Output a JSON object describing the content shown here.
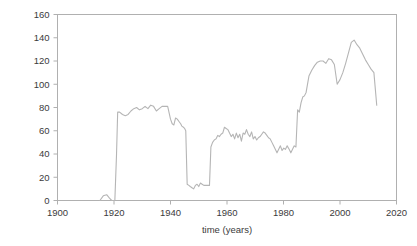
{
  "chart_data": {
    "type": "line",
    "title": "",
    "xlabel": "time (years)",
    "ylabel": "rain gauge stations (number)",
    "xlim": [
      1900,
      2020
    ],
    "ylim": [
      0,
      160
    ],
    "xticks": [
      1900,
      1920,
      1940,
      1960,
      1980,
      2000,
      2020
    ],
    "yticks": [
      0,
      20,
      40,
      60,
      80,
      100,
      120,
      140,
      160
    ],
    "grid": false,
    "legend": null,
    "line_color": "#b5b5b5",
    "series": [
      {
        "name": "rain gauge stations",
        "x": [
          1915,
          1916,
          1917,
          1918,
          1919,
          1920,
          1921,
          1922,
          1923,
          1924,
          1925,
          1926,
          1927,
          1928,
          1929,
          1930,
          1931,
          1932,
          1933,
          1934,
          1935,
          1936,
          1937,
          1938,
          1939,
          1940,
          1941,
          1942,
          1943,
          1944,
          1945,
          1946,
          1947,
          1948,
          1949,
          1950,
          1951,
          1952,
          1953,
          1954,
          1955,
          1956,
          1957,
          1958,
          1959,
          1960,
          1961,
          1962,
          1963,
          1964,
          1965,
          1966,
          1967,
          1968,
          1969,
          1970,
          1971,
          1972,
          1973,
          1974,
          1975,
          1976,
          1977,
          1978,
          1979,
          1980,
          1981,
          1982,
          1983,
          1984,
          1985,
          1986,
          1987,
          1988,
          1989,
          1990,
          1991,
          1992,
          1993,
          1994,
          1995,
          1996,
          1997,
          1998,
          1999,
          2000,
          2001,
          2002,
          2003,
          2004,
          2005,
          2006,
          2007,
          2008,
          2009,
          2010,
          2011,
          2012,
          2013,
          2014,
          2015,
          2016,
          2017,
          2018
        ],
        "values": [
          0,
          3,
          4,
          2,
          0,
          0,
          62,
          76,
          75,
          73,
          74,
          76,
          78,
          80,
          79,
          78,
          80,
          79,
          82,
          81,
          76,
          78,
          80,
          81,
          81,
          75,
          66,
          65,
          71,
          70,
          69,
          68,
          66,
          62,
          62,
          60,
          14,
          13,
          12,
          10,
          13,
          14,
          12,
          15,
          14,
          13,
          13,
          13,
          46,
          50,
          52,
          53,
          56,
          55,
          57,
          58,
          63,
          62,
          61,
          58,
          55,
          57,
          53,
          58,
          54,
          57,
          51,
          58,
          57,
          61,
          57,
          55,
          59,
          53,
          55,
          52,
          54,
          55,
          57,
          59,
          58,
          56,
          54,
          53,
          50,
          47,
          44,
          41,
          44,
          47,
          43,
          45,
          44,
          47,
          78,
          76,
          84,
          89,
          90,
          93,
          107,
          112,
          116,
          119
        ],
        "note": "Series values correspond sequentially to the plotted year positions."
      }
    ],
    "polyline_points_normalized": [
      [
        1915.0,
        0
      ],
      [
        1916.2,
        4
      ],
      [
        1917.4,
        5
      ],
      [
        1918.4,
        2
      ],
      [
        1919.2,
        0
      ],
      [
        1920.3,
        0
      ],
      [
        1920.9,
        40
      ],
      [
        1921.3,
        76
      ],
      [
        1922.0,
        76
      ],
      [
        1923.0,
        74
      ],
      [
        1924.0,
        73
      ],
      [
        1925.0,
        74
      ],
      [
        1926.0,
        77
      ],
      [
        1927.0,
        79
      ],
      [
        1928.0,
        80
      ],
      [
        1929.0,
        78
      ],
      [
        1930.0,
        79
      ],
      [
        1931.0,
        81
      ],
      [
        1932.0,
        79
      ],
      [
        1933.0,
        82
      ],
      [
        1934.0,
        81
      ],
      [
        1935.0,
        77
      ],
      [
        1936.0,
        79
      ],
      [
        1937.0,
        81
      ],
      [
        1938.0,
        81
      ],
      [
        1939.0,
        81
      ],
      [
        1940.0,
        70
      ],
      [
        1940.6,
        66
      ],
      [
        1941.2,
        65
      ],
      [
        1941.8,
        71
      ],
      [
        1942.4,
        70
      ],
      [
        1943.0,
        68
      ],
      [
        1943.6,
        66
      ],
      [
        1944.0,
        64
      ],
      [
        1944.6,
        63
      ],
      [
        1945.0,
        62
      ],
      [
        1945.4,
        60
      ],
      [
        1945.9,
        14
      ],
      [
        1946.5,
        13
      ],
      [
        1947.0,
        12
      ],
      [
        1947.6,
        11
      ],
      [
        1948.2,
        10
      ],
      [
        1948.8,
        13
      ],
      [
        1949.4,
        14
      ],
      [
        1950.0,
        12
      ],
      [
        1950.6,
        15
      ],
      [
        1951.2,
        14
      ],
      [
        1951.8,
        13
      ],
      [
        1952.4,
        13
      ],
      [
        1953.0,
        13
      ],
      [
        1953.8,
        13
      ],
      [
        1954.3,
        46
      ],
      [
        1954.9,
        50
      ],
      [
        1955.5,
        52
      ],
      [
        1956.1,
        53
      ],
      [
        1956.7,
        56
      ],
      [
        1957.3,
        55
      ],
      [
        1957.9,
        57
      ],
      [
        1958.5,
        58
      ],
      [
        1959.1,
        63
      ],
      [
        1959.7,
        62
      ],
      [
        1960.3,
        61
      ],
      [
        1960.9,
        58
      ],
      [
        1961.5,
        55
      ],
      [
        1962.1,
        57
      ],
      [
        1962.7,
        53
      ],
      [
        1963.3,
        58
      ],
      [
        1963.9,
        54
      ],
      [
        1964.5,
        57
      ],
      [
        1965.1,
        51
      ],
      [
        1965.7,
        58
      ],
      [
        1966.3,
        57
      ],
      [
        1966.9,
        61
      ],
      [
        1967.5,
        57
      ],
      [
        1968.1,
        55
      ],
      [
        1968.7,
        59
      ],
      [
        1969.3,
        53
      ],
      [
        1969.9,
        55
      ],
      [
        1970.5,
        52
      ],
      [
        1971.1,
        54
      ],
      [
        1971.7,
        55
      ],
      [
        1972.3,
        57
      ],
      [
        1972.9,
        59
      ],
      [
        1973.5,
        58
      ],
      [
        1974.1,
        56
      ],
      [
        1974.7,
        54
      ],
      [
        1975.3,
        53
      ],
      [
        1975.9,
        50
      ],
      [
        1976.5,
        47
      ],
      [
        1977.1,
        44
      ],
      [
        1977.7,
        41
      ],
      [
        1978.3,
        44
      ],
      [
        1978.9,
        47
      ],
      [
        1979.5,
        43
      ],
      [
        1980.1,
        45
      ],
      [
        1980.7,
        44
      ],
      [
        1981.3,
        47
      ],
      [
        1982.0,
        44
      ],
      [
        1982.6,
        41
      ],
      [
        1983.2,
        44
      ],
      [
        1983.8,
        47
      ],
      [
        1984.4,
        46
      ],
      [
        1985.0,
        78
      ],
      [
        1985.6,
        76
      ],
      [
        1986.2,
        84
      ],
      [
        1986.8,
        89
      ],
      [
        1987.4,
        90
      ],
      [
        1988.0,
        93
      ],
      [
        1989.0,
        107
      ],
      [
        1990.0,
        112
      ],
      [
        1991.0,
        116
      ],
      [
        1992.0,
        119
      ],
      [
        1993.0,
        120
      ],
      [
        1994.0,
        120
      ],
      [
        1995.0,
        118
      ],
      [
        1996.0,
        122
      ],
      [
        1997.0,
        121
      ],
      [
        1998.0,
        117
      ],
      [
        1999.0,
        100
      ],
      [
        2000.0,
        104
      ],
      [
        2001.0,
        110
      ],
      [
        2002.0,
        118
      ],
      [
        2003.0,
        127
      ],
      [
        2004.0,
        136
      ],
      [
        2005.0,
        138
      ],
      [
        2006.0,
        134
      ],
      [
        2007.0,
        131
      ],
      [
        2008.0,
        126
      ],
      [
        2009.0,
        121
      ],
      [
        2010.0,
        117
      ],
      [
        2011.0,
        113
      ],
      [
        2012.0,
        110
      ],
      [
        2013.0,
        82
      ]
    ]
  },
  "axes": {
    "frame_color": "#b0b0b0",
    "tick_color": "#b0b0b0",
    "text_color": "#3b3b3b"
  }
}
